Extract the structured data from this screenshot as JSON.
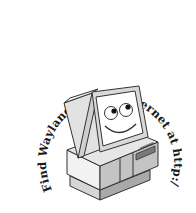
{
  "logo": {
    "arc_text": "Find Wayland on the Internet at http://www.wayland.co.uk",
    "illustration": "smiling-computer",
    "colors": {
      "outline": "#333333",
      "light_face": "#f2f2f2",
      "mid_face": "#cfcfcf",
      "dark_face": "#a9a9a9",
      "screen": "#ffffff",
      "text": "#1a1a1a"
    }
  }
}
